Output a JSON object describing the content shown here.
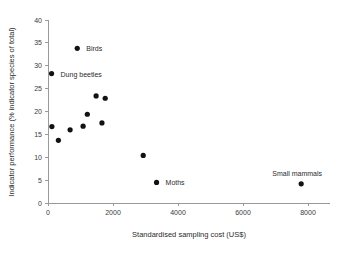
{
  "chart_data": {
    "type": "scatter",
    "title": "",
    "xlabel": "Standardised sampling cost (US$)",
    "ylabel": "Indicator performance (% indicator species of total)",
    "xlim": [
      0,
      8600
    ],
    "ylim": [
      0,
      40
    ],
    "xticks": [
      0,
      2000,
      4000,
      6000,
      8000
    ],
    "xtick_labels": [
      "0",
      "2000",
      "4000",
      "6000",
      "8000"
    ],
    "yticks": [
      0,
      5,
      10,
      15,
      20,
      25,
      30,
      35,
      40
    ],
    "ytick_labels": [
      "0",
      "5",
      "10",
      "15",
      "20",
      "25",
      "30",
      "35",
      "40"
    ],
    "grid": false,
    "legend": false,
    "marker": "filled-circle",
    "marker_color": "#121212",
    "points": [
      {
        "x": 110,
        "y": 28.3,
        "label": "Dung beetles",
        "label_dx": 9,
        "label_dy": 3
      },
      {
        "x": 900,
        "y": 33.8,
        "label": "Birds",
        "label_dx": 9,
        "label_dy": 3
      },
      {
        "x": 120,
        "y": 16.7,
        "label": "",
        "label_dx": 0,
        "label_dy": 0
      },
      {
        "x": 320,
        "y": 13.7,
        "label": "",
        "label_dx": 0,
        "label_dy": 0
      },
      {
        "x": 680,
        "y": 16.0,
        "label": "",
        "label_dx": 0,
        "label_dy": 0
      },
      {
        "x": 1080,
        "y": 16.8,
        "label": "",
        "label_dx": 0,
        "label_dy": 0
      },
      {
        "x": 1210,
        "y": 19.4,
        "label": "",
        "label_dx": 0,
        "label_dy": 0
      },
      {
        "x": 1480,
        "y": 23.4,
        "label": "",
        "label_dx": 0,
        "label_dy": 0
      },
      {
        "x": 1660,
        "y": 17.5,
        "label": "",
        "label_dx": 0,
        "label_dy": 0
      },
      {
        "x": 1760,
        "y": 22.9,
        "label": "",
        "label_dx": 0,
        "label_dy": 0
      },
      {
        "x": 2930,
        "y": 10.4,
        "label": "",
        "label_dx": 0,
        "label_dy": 0
      },
      {
        "x": 3340,
        "y": 4.5,
        "label": "Moths",
        "label_dx": 9,
        "label_dy": 3
      },
      {
        "x": 7790,
        "y": 4.2,
        "label": "Small mammals",
        "label_dx": -4,
        "label_dy": -8
      }
    ]
  },
  "axes_geometry": {
    "origin_x_px": 48,
    "origin_y_px": 203,
    "x_axis_end_px": 330,
    "y_axis_top_px": 20,
    "x_units_per_px": 30.77,
    "y_units_per_px": 0.2186
  }
}
